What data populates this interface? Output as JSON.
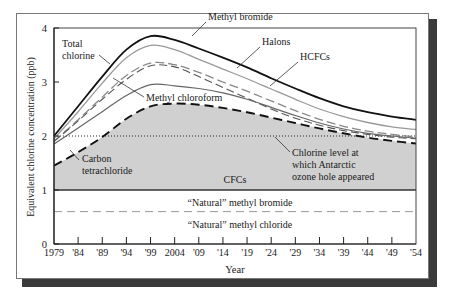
{
  "chart_data": {
    "type": "area",
    "title": "",
    "xlabel": "Year",
    "ylabel": "Equivalent chlorine concentration (ppb)",
    "xlim": [
      1979,
      2054
    ],
    "ylim": [
      0,
      4
    ],
    "x_ticks": [
      1979,
      1984,
      1989,
      1994,
      1999,
      2004,
      2009,
      2014,
      2019,
      2024,
      2029,
      2034,
      2039,
      2044,
      2049,
      2054
    ],
    "x_tick_labels": [
      "1979",
      "'84",
      "'89",
      "'94",
      "'99",
      "2004",
      "'09",
      "'14",
      "'19",
      "'24",
      "'29",
      "'34",
      "'39",
      "'44",
      "'49",
      "'54"
    ],
    "y_ticks": [
      0,
      1,
      2,
      3,
      4
    ],
    "y_tick_labels": [
      "0",
      "1",
      "2",
      "3",
      "4"
    ],
    "grid": false,
    "x": [
      1979,
      1984,
      1989,
      1994,
      1999,
      2004,
      2009,
      2014,
      2019,
      2024,
      2029,
      2034,
      2039,
      2044,
      2049,
      2054
    ],
    "series": [
      {
        "name": "Total chlorine",
        "style": "solid-thick",
        "values": [
          2.0,
          2.55,
          3.1,
          3.6,
          3.85,
          3.78,
          3.62,
          3.45,
          3.27,
          3.07,
          2.88,
          2.7,
          2.55,
          2.44,
          2.36,
          2.3
        ]
      },
      {
        "name": "Methyl bromide",
        "style": "solid-gray",
        "values": [
          1.95,
          2.45,
          2.98,
          3.45,
          3.68,
          3.6,
          3.42,
          3.24,
          3.06,
          2.87,
          2.68,
          2.5,
          2.36,
          2.25,
          2.17,
          2.12
        ]
      },
      {
        "name": "Halons",
        "style": "dashed-gray",
        "values": [
          1.9,
          2.3,
          2.72,
          3.12,
          3.35,
          3.32,
          3.18,
          3.0,
          2.83,
          2.65,
          2.47,
          2.31,
          2.18,
          2.09,
          2.03,
          1.98
        ]
      },
      {
        "name": "HCFCs",
        "style": "dashed-thin",
        "values": [
          1.9,
          2.28,
          2.68,
          3.05,
          3.3,
          3.28,
          3.1,
          2.9,
          2.7,
          2.5,
          2.33,
          2.2,
          2.1,
          2.03,
          1.98,
          1.95
        ]
      },
      {
        "name": "Methyl chloroform",
        "style": "solid-thin",
        "values": [
          1.85,
          2.15,
          2.45,
          2.75,
          2.95,
          2.93,
          2.88,
          2.8,
          2.68,
          2.53,
          2.38,
          2.24,
          2.13,
          2.05,
          2.0,
          1.96
        ]
      },
      {
        "name": "CFCs",
        "style": "dashed-thick",
        "values": [
          1.45,
          1.7,
          1.98,
          2.32,
          2.55,
          2.6,
          2.58,
          2.52,
          2.44,
          2.34,
          2.24,
          2.14,
          2.05,
          1.97,
          1.91,
          1.86
        ]
      },
      {
        "name": "Carbon tetrachloride base",
        "style": "none",
        "values": [
          1.0,
          1.0,
          1.0,
          1.0,
          1.0,
          1.0,
          1.0,
          1.0,
          1.0,
          1.0,
          1.0,
          1.0,
          1.0,
          1.0,
          1.0,
          1.0
        ]
      }
    ],
    "reference_lines": [
      {
        "name": "Chlorine level at which Antarctic ozone hole appeared",
        "y": 2.0,
        "style": "dotted"
      },
      {
        "name": "Natural methyl bromide / methyl chloride boundary",
        "y": 0.6,
        "style": "dashed-gray"
      },
      {
        "name": "Natural baseline",
        "y": 1.0,
        "style": "solid"
      }
    ],
    "shaded_region": {
      "name": "CFCs",
      "from_series": "Carbon tetrachloride base",
      "to_series": "CFCs",
      "color": "#d0d0d0"
    },
    "annotations": [
      {
        "text_lines": [
          "Total",
          "chlorine"
        ],
        "points_to": "Total chlorine"
      },
      {
        "text_lines": [
          "Methyl bromide"
        ],
        "points_to": "Methyl bromide"
      },
      {
        "text_lines": [
          "Halons"
        ],
        "points_to": "Halons"
      },
      {
        "text_lines": [
          "HCFCs"
        ],
        "points_to": "HCFCs"
      },
      {
        "text_lines": [
          "Methyl chloroform"
        ],
        "points_to": "Methyl chloroform"
      },
      {
        "text_lines": [
          "Carbon",
          "tetrachloride"
        ],
        "points_to": "CFCs"
      },
      {
        "text_lines": [
          "CFCs"
        ],
        "points_to": "shaded region"
      },
      {
        "text_lines": [
          "Chlorine level at",
          "which Antarctic",
          "ozone hole appeared"
        ],
        "points_to": "dotted line"
      },
      {
        "text_lines": [
          "“Natural” methyl bromide"
        ],
        "points_to": "band 0.6-1"
      },
      {
        "text_lines": [
          "“Natural” methyl chloride"
        ],
        "points_to": "band 0-0.6"
      }
    ],
    "legend": "none"
  }
}
